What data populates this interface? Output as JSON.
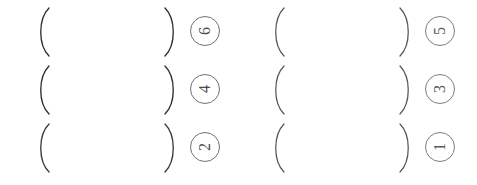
{
  "document": {
    "kind": "scanned-worksheet-answer-blanks",
    "background_color": "#ffffff",
    "ink_color": "#2e2e30",
    "marker_color": "#6f6f74",
    "orientation_note": "90",
    "open_paren": "(",
    "close_paren": ")"
  },
  "rows": [
    {
      "groups": [
        {
          "number": "6",
          "open": "(",
          "close": ")"
        },
        {
          "number": "5",
          "open": "(",
          "close": ")"
        }
      ]
    },
    {
      "groups": [
        {
          "number": "4",
          "open": "(",
          "close": ")"
        },
        {
          "number": "3",
          "open": "(",
          "close": ")"
        }
      ]
    },
    {
      "groups": [
        {
          "number": "2",
          "open": "(",
          "close": ")"
        },
        {
          "number": "1",
          "open": "(",
          "close": ")"
        }
      ]
    }
  ]
}
